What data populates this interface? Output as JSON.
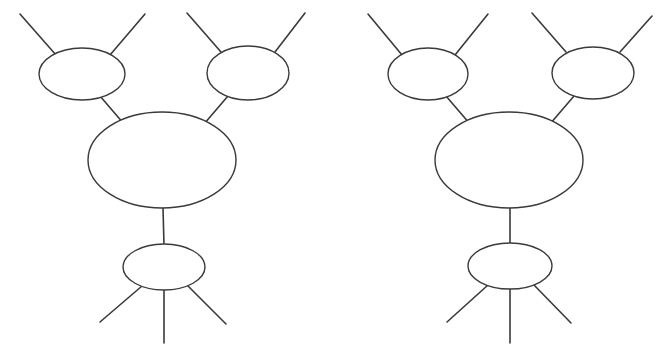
{
  "page": {
    "background_color": "#ffffff",
    "width": 665,
    "height": 351
  },
  "style": {
    "stroke_color": "#3a3a3a",
    "node_fill": "#ffffff",
    "node_stroke_width": 1.4,
    "edge_stroke_width": 1.6
  },
  "chart_data": {
    "type": "diagram",
    "diagram_count": 2,
    "diagrams": [
      {
        "name": "left-diagram",
        "nodes": [
          {
            "name": "upper-left-blob",
            "cx": 82,
            "cy": 74,
            "rx": 43,
            "ry": 26
          },
          {
            "name": "upper-right-blob",
            "cx": 248,
            "cy": 73,
            "rx": 41,
            "ry": 27
          },
          {
            "name": "center-blob",
            "cx": 162,
            "cy": 160,
            "rx": 74,
            "ry": 48
          },
          {
            "name": "bottom-blob",
            "cx": 164,
            "cy": 267,
            "rx": 41,
            "ry": 23
          }
        ],
        "edges": [
          {
            "name": "upper-left-outer-leg-left",
            "x1": 20,
            "y1": 14,
            "x2": 56,
            "y2": 55
          },
          {
            "name": "upper-left-outer-leg-right",
            "x1": 145,
            "y1": 14,
            "x2": 110,
            "y2": 55
          },
          {
            "name": "upper-right-outer-leg-left",
            "x1": 187,
            "y1": 13,
            "x2": 221,
            "y2": 52
          },
          {
            "name": "upper-right-outer-leg-right",
            "x1": 305,
            "y1": 13,
            "x2": 275,
            "y2": 52
          },
          {
            "name": "upper-left-to-center",
            "x1": 100,
            "y1": 96,
            "x2": 124,
            "y2": 124
          },
          {
            "name": "upper-right-to-center",
            "x1": 228,
            "y1": 96,
            "x2": 204,
            "y2": 124
          },
          {
            "name": "center-to-bottom",
            "x1": 163,
            "y1": 208,
            "x2": 164,
            "y2": 245
          },
          {
            "name": "bottom-outer-leg-left",
            "x1": 142,
            "y1": 286,
            "x2": 100,
            "y2": 322
          },
          {
            "name": "bottom-outer-leg-center",
            "x1": 164,
            "y1": 290,
            "x2": 164,
            "y2": 343
          },
          {
            "name": "bottom-outer-leg-right",
            "x1": 188,
            "y1": 286,
            "x2": 226,
            "y2": 324
          }
        ]
      },
      {
        "name": "right-diagram",
        "nodes": [
          {
            "name": "upper-left-blob",
            "cx": 428,
            "cy": 74,
            "rx": 40,
            "ry": 26
          },
          {
            "name": "upper-right-blob",
            "cx": 593,
            "cy": 73,
            "rx": 41,
            "ry": 26
          },
          {
            "name": "center-blob",
            "cx": 509,
            "cy": 160,
            "rx": 74,
            "ry": 48
          },
          {
            "name": "bottom-blob",
            "cx": 510,
            "cy": 266,
            "rx": 42,
            "ry": 23
          }
        ],
        "edges": [
          {
            "name": "upper-left-outer-leg-left",
            "x1": 368,
            "y1": 14,
            "x2": 402,
            "y2": 55
          },
          {
            "name": "upper-left-outer-leg-right",
            "x1": 488,
            "y1": 14,
            "x2": 455,
            "y2": 55
          },
          {
            "name": "upper-right-outer-leg-left",
            "x1": 532,
            "y1": 13,
            "x2": 566,
            "y2": 52
          },
          {
            "name": "upper-right-outer-leg-right",
            "x1": 652,
            "y1": 16,
            "x2": 620,
            "y2": 52
          },
          {
            "name": "upper-left-to-center",
            "x1": 446,
            "y1": 96,
            "x2": 470,
            "y2": 124
          },
          {
            "name": "upper-right-to-center",
            "x1": 574,
            "y1": 96,
            "x2": 550,
            "y2": 124
          },
          {
            "name": "center-to-bottom",
            "x1": 510,
            "y1": 208,
            "x2": 510,
            "y2": 244
          },
          {
            "name": "bottom-outer-leg-left",
            "x1": 488,
            "y1": 285,
            "x2": 447,
            "y2": 322
          },
          {
            "name": "bottom-outer-leg-center",
            "x1": 510,
            "y1": 289,
            "x2": 510,
            "y2": 343
          },
          {
            "name": "bottom-outer-leg-right",
            "x1": 534,
            "y1": 285,
            "x2": 571,
            "y2": 323
          }
        ]
      }
    ]
  }
}
